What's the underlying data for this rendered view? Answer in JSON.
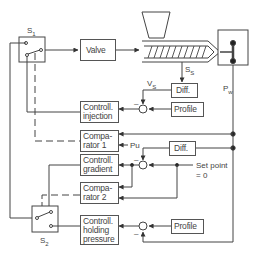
{
  "diagram": {
    "title": "",
    "blocks": {
      "valve": "Valve",
      "diff_top": "Diff.",
      "profile_1": "Profile",
      "controll_injection": [
        "Controll.",
        "injection"
      ],
      "comparator_1": [
        "Compa-",
        "rator 1"
      ],
      "diff_mid": "Diff.",
      "controll_gradient": [
        "Controll.",
        "gradient"
      ],
      "comparator_2": [
        "Compa-",
        "rator 2"
      ],
      "controll_holding": [
        "Controll.",
        "holding",
        "pressure"
      ],
      "profile_2": "Profile"
    },
    "labels": {
      "s1": "S",
      "s1_sub": "1",
      "s2": "S",
      "s2_sub": "2",
      "vs": "V",
      "vs_sub": "S",
      "ss": "S",
      "ss_sub": "S",
      "pw": "P",
      "pw_sub": "w",
      "pu": "Pu",
      "setpoint_1": "Set point",
      "setpoint_2": "= 0",
      "minus": "–"
    },
    "components": [
      "hopper",
      "screw-barrel",
      "mold"
    ],
    "colors": {
      "line": "#444444",
      "background": "#ffffff"
    }
  }
}
